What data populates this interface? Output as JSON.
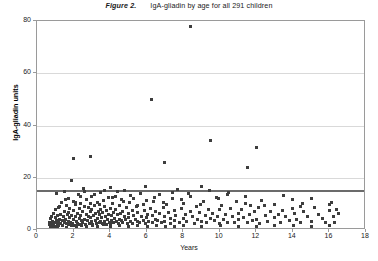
{
  "figure": {
    "number_label": "Figure 2.",
    "caption": "IgA-gliadin  by age for all 291 children",
    "x_axis_title": "Years",
    "y_axis_title": "IgA-gliadin units"
  },
  "chart_data": {
    "type": "scatter",
    "xlabel": "Years",
    "ylabel": "IgA-gliadin units",
    "xlim": [
      0,
      18
    ],
    "ylim": [
      0,
      80
    ],
    "xticks": [
      0,
      2,
      4,
      6,
      8,
      10,
      12,
      14,
      16,
      18
    ],
    "yticks": [
      0,
      20,
      40,
      60,
      80
    ],
    "grid": "horizontal-only",
    "legend": "none",
    "n_points": 291,
    "marker": "square",
    "marker_color": "#3d3d3d",
    "reference_line": {
      "orientation": "horizontal",
      "y": 15,
      "color": "#6b6b6b",
      "label": "cut-off"
    },
    "series": [
      {
        "name": "IgA-gliadin by age",
        "points": [
          [
            0.7,
            2.1
          ],
          [
            0.7,
            3.0
          ],
          [
            0.75,
            4.4
          ],
          [
            0.8,
            1.6
          ],
          [
            0.8,
            2.6
          ],
          [
            0.82,
            5.1
          ],
          [
            0.85,
            3.4
          ],
          [
            0.9,
            2.0
          ],
          [
            0.9,
            6.2
          ],
          [
            0.95,
            1.4
          ],
          [
            1.0,
            2.8
          ],
          [
            1.0,
            4.8
          ],
          [
            1.0,
            7.9
          ],
          [
            1.05,
            3.6
          ],
          [
            1.1,
            2.2
          ],
          [
            1.1,
            5.6
          ],
          [
            1.15,
            1.9
          ],
          [
            1.2,
            3.1
          ],
          [
            1.2,
            8.8
          ],
          [
            1.25,
            4.2
          ],
          [
            1.3,
            2.4
          ],
          [
            1.3,
            6.0
          ],
          [
            1.35,
            10.4
          ],
          [
            1.4,
            1.7
          ],
          [
            1.4,
            3.8
          ],
          [
            1.45,
            5.2
          ],
          [
            1.5,
            2.9
          ],
          [
            1.5,
            7.1
          ],
          [
            1.5,
            14.9
          ],
          [
            1.55,
            4.0
          ],
          [
            1.6,
            2.3
          ],
          [
            1.6,
            9.2
          ],
          [
            1.65,
            5.9
          ],
          [
            1.7,
            3.3
          ],
          [
            1.7,
            6.8
          ],
          [
            1.72,
            12.1
          ],
          [
            1.75,
            2.0
          ],
          [
            1.8,
            4.6
          ],
          [
            1.8,
            8.1
          ],
          [
            1.85,
            3.0
          ],
          [
            1.9,
            5.4
          ],
          [
            1.9,
            18.9
          ],
          [
            1.95,
            2.6
          ],
          [
            2.0,
            3.9
          ],
          [
            2.0,
            7.4
          ],
          [
            2.0,
            11.0
          ],
          [
            2.02,
            27.5
          ],
          [
            2.05,
            1.8
          ],
          [
            2.1,
            5.0
          ],
          [
            2.1,
            9.6
          ],
          [
            2.15,
            3.2
          ],
          [
            2.2,
            6.5
          ],
          [
            2.2,
            2.5
          ],
          [
            2.25,
            13.4
          ],
          [
            2.3,
            4.3
          ],
          [
            2.3,
            8.3
          ],
          [
            2.35,
            2.1
          ],
          [
            2.4,
            5.7
          ],
          [
            2.4,
            10.1
          ],
          [
            2.45,
            3.5
          ],
          [
            2.5,
            7.0
          ],
          [
            2.5,
            2.7
          ],
          [
            2.55,
            15.8
          ],
          [
            2.6,
            4.1
          ],
          [
            2.6,
            9.0
          ],
          [
            2.65,
            2.2
          ],
          [
            2.7,
            6.1
          ],
          [
            2.7,
            11.6
          ],
          [
            2.75,
            3.7
          ],
          [
            2.8,
            5.3
          ],
          [
            2.8,
            8.6
          ],
          [
            2.85,
            2.4
          ],
          [
            2.9,
            4.9
          ],
          [
            2.9,
            28.3
          ],
          [
            2.95,
            6.9
          ],
          [
            3.0,
            3.1
          ],
          [
            3.0,
            7.7
          ],
          [
            3.0,
            12.8
          ],
          [
            3.05,
            2.0
          ],
          [
            3.1,
            5.5
          ],
          [
            3.15,
            9.4
          ],
          [
            3.2,
            3.6
          ],
          [
            3.2,
            6.3
          ],
          [
            3.25,
            2.3
          ],
          [
            3.3,
            4.5
          ],
          [
            3.3,
            10.7
          ],
          [
            3.35,
            7.2
          ],
          [
            3.4,
            2.8
          ],
          [
            3.4,
            5.8
          ],
          [
            3.45,
            3.3
          ],
          [
            3.5,
            8.0
          ],
          [
            3.5,
            14.2
          ],
          [
            3.55,
            4.7
          ],
          [
            3.6,
            2.6
          ],
          [
            3.6,
            6.6
          ],
          [
            3.65,
            11.3
          ],
          [
            3.7,
            3.4
          ],
          [
            3.7,
            9.1
          ],
          [
            3.75,
            5.1
          ],
          [
            3.8,
            2.2
          ],
          [
            3.8,
            7.5
          ],
          [
            3.85,
            4.0
          ],
          [
            3.9,
            12.4
          ],
          [
            3.9,
            6.0
          ],
          [
            3.95,
            3.0
          ],
          [
            4.0,
            8.4
          ],
          [
            4.0,
            2.5
          ],
          [
            4.0,
            16.1
          ],
          [
            4.05,
            5.6
          ],
          [
            4.1,
            3.8
          ],
          [
            4.15,
            10.0
          ],
          [
            4.2,
            6.7
          ],
          [
            4.2,
            2.9
          ],
          [
            4.25,
            4.4
          ],
          [
            4.3,
            13.0
          ],
          [
            4.3,
            7.8
          ],
          [
            4.35,
            3.2
          ],
          [
            4.4,
            5.9
          ],
          [
            4.45,
            2.4
          ],
          [
            4.5,
            9.3
          ],
          [
            4.5,
            4.1
          ],
          [
            4.55,
            6.4
          ],
          [
            4.6,
            3.5
          ],
          [
            4.6,
            11.8
          ],
          [
            4.7,
            7.0
          ],
          [
            4.7,
            2.7
          ],
          [
            4.8,
            5.0
          ],
          [
            4.8,
            15.3
          ],
          [
            4.85,
            3.9
          ],
          [
            4.9,
            8.7
          ],
          [
            4.95,
            2.3
          ],
          [
            5.0,
            6.2
          ],
          [
            5.0,
            4.6
          ],
          [
            5.05,
            10.5
          ],
          [
            5.1,
            3.1
          ],
          [
            5.2,
            7.6
          ],
          [
            5.2,
            2.6
          ],
          [
            5.3,
            5.4
          ],
          [
            5.3,
            12.2
          ],
          [
            5.4,
            4.0
          ],
          [
            5.45,
            8.9
          ],
          [
            5.5,
            3.4
          ],
          [
            5.5,
            6.8
          ],
          [
            5.6,
            2.8
          ],
          [
            5.65,
            14.0
          ],
          [
            5.7,
            5.2
          ],
          [
            5.8,
            9.8
          ],
          [
            5.8,
            3.7
          ],
          [
            5.9,
            7.3
          ],
          [
            5.95,
            2.5
          ],
          [
            6.0,
            4.8
          ],
          [
            6.0,
            11.2
          ],
          [
            6.05,
            6.0
          ],
          [
            6.1,
            3.3
          ],
          [
            6.2,
            8.2
          ],
          [
            6.25,
            50.0
          ],
          [
            6.3,
            5.7
          ],
          [
            6.3,
            2.9
          ],
          [
            6.4,
            10.9
          ],
          [
            6.5,
            4.2
          ],
          [
            6.5,
            7.0
          ],
          [
            6.6,
            3.6
          ],
          [
            6.7,
            6.4
          ],
          [
            6.7,
            13.6
          ],
          [
            6.8,
            2.7
          ],
          [
            6.9,
            8.5
          ],
          [
            7.0,
            5.0
          ],
          [
            7.0,
            3.2
          ],
          [
            7.0,
            26.0
          ],
          [
            7.1,
            9.9
          ],
          [
            7.2,
            6.6
          ],
          [
            7.3,
            4.3
          ],
          [
            7.3,
            2.4
          ],
          [
            7.4,
            12.0
          ],
          [
            7.5,
            7.4
          ],
          [
            7.5,
            3.8
          ],
          [
            7.6,
            5.5
          ],
          [
            7.7,
            15.5
          ],
          [
            7.8,
            2.8
          ],
          [
            7.9,
            8.1
          ],
          [
            8.0,
            4.5
          ],
          [
            8.0,
            10.3
          ],
          [
            8.1,
            6.1
          ],
          [
            8.2,
            3.1
          ],
          [
            8.3,
            13.8
          ],
          [
            8.4,
            78.0
          ],
          [
            8.4,
            7.0
          ],
          [
            8.5,
            5.1
          ],
          [
            8.6,
            2.6
          ],
          [
            8.7,
            9.0
          ],
          [
            8.8,
            4.0
          ],
          [
            8.9,
            6.8
          ],
          [
            9.0,
            3.4
          ],
          [
            9.0,
            16.5
          ],
          [
            9.1,
            11.0
          ],
          [
            9.2,
            5.6
          ],
          [
            9.3,
            2.9
          ],
          [
            9.4,
            8.0
          ],
          [
            9.5,
            4.4
          ],
          [
            9.5,
            34.2
          ],
          [
            9.6,
            6.2
          ],
          [
            9.7,
            3.6
          ],
          [
            9.8,
            12.6
          ],
          [
            9.9,
            5.0
          ],
          [
            10.0,
            7.7
          ],
          [
            10.0,
            2.5
          ],
          [
            10.1,
            9.5
          ],
          [
            10.2,
            4.1
          ],
          [
            10.3,
            6.0
          ],
          [
            10.4,
            3.0
          ],
          [
            10.5,
            14.5
          ],
          [
            10.6,
            8.3
          ],
          [
            10.7,
            5.3
          ],
          [
            10.8,
            2.7
          ],
          [
            10.9,
            10.8
          ],
          [
            11.0,
            6.5
          ],
          [
            11.0,
            3.9
          ],
          [
            11.2,
            7.9
          ],
          [
            11.3,
            4.6
          ],
          [
            11.4,
            12.9
          ],
          [
            11.5,
            2.8
          ],
          [
            11.5,
            24.1
          ],
          [
            11.6,
            5.8
          ],
          [
            11.7,
            9.2
          ],
          [
            11.8,
            3.5
          ],
          [
            11.9,
            6.9
          ],
          [
            12.0,
            31.6
          ],
          [
            12.0,
            4.2
          ],
          [
            12.1,
            8.6
          ],
          [
            12.2,
            2.6
          ],
          [
            12.3,
            11.4
          ],
          [
            12.5,
            5.4
          ],
          [
            12.6,
            3.2
          ],
          [
            12.8,
            7.2
          ],
          [
            13.0,
            4.8
          ],
          [
            13.0,
            9.9
          ],
          [
            13.2,
            6.1
          ],
          [
            13.3,
            2.9
          ],
          [
            13.5,
            13.2
          ],
          [
            13.6,
            5.0
          ],
          [
            13.8,
            3.7
          ],
          [
            14.0,
            8.4
          ],
          [
            14.0,
            11.6
          ],
          [
            14.1,
            6.3
          ],
          [
            14.2,
            4.1
          ],
          [
            14.4,
            2.8
          ],
          [
            14.5,
            10.2
          ],
          [
            14.6,
            7.0
          ],
          [
            14.8,
            5.2
          ],
          [
            15.0,
            3.4
          ],
          [
            15.0,
            12.1
          ],
          [
            15.2,
            8.8
          ],
          [
            15.4,
            6.0
          ],
          [
            15.6,
            4.4
          ],
          [
            15.8,
            2.7
          ],
          [
            16.0,
            9.6
          ],
          [
            16.0,
            7.3
          ],
          [
            16.1,
            10.5
          ],
          [
            16.2,
            5.1
          ],
          [
            16.3,
            3.0
          ],
          [
            16.4,
            8.0
          ],
          [
            16.5,
            6.4
          ],
          [
            1.05,
            13.9
          ],
          [
            1.25,
            9.1
          ],
          [
            1.55,
            11.8
          ],
          [
            2.12,
            10.6
          ],
          [
            2.38,
            12.7
          ],
          [
            2.62,
            14.8
          ],
          [
            2.92,
            10.0
          ],
          [
            3.12,
            13.5
          ],
          [
            3.42,
            9.7
          ],
          [
            3.72,
            15.0
          ],
          [
            4.12,
            12.5
          ],
          [
            4.42,
            14.6
          ],
          [
            4.72,
            11.1
          ],
          [
            5.12,
            13.1
          ],
          [
            5.52,
            9.5
          ],
          [
            5.92,
            16.8
          ],
          [
            6.42,
            12.3
          ],
          [
            6.92,
            10.4
          ],
          [
            7.42,
            14.3
          ],
          [
            7.92,
            11.5
          ],
          [
            8.42,
            13.0
          ],
          [
            8.92,
            9.8
          ],
          [
            9.42,
            15.1
          ],
          [
            9.92,
            11.9
          ],
          [
            10.42,
            13.4
          ],
          [
            11.42,
            10.1
          ],
          [
            12.42,
            9.4
          ],
          [
            13.42,
            7.6
          ],
          [
            14.42,
            9.0
          ],
          [
            0.72,
            1.2
          ],
          [
            0.88,
            1.5
          ],
          [
            1.12,
            1.3
          ],
          [
            1.38,
            1.8
          ],
          [
            1.62,
            1.1
          ],
          [
            1.88,
            1.6
          ],
          [
            2.18,
            1.4
          ],
          [
            2.42,
            1.9
          ],
          [
            2.72,
            1.2
          ],
          [
            3.02,
            1.7
          ],
          [
            3.32,
            1.3
          ],
          [
            3.62,
            2.0
          ],
          [
            4.02,
            1.5
          ],
          [
            4.52,
            1.8
          ],
          [
            5.02,
            1.4
          ],
          [
            5.52,
            1.6
          ],
          [
            6.02,
            1.3
          ],
          [
            6.52,
            1.9
          ],
          [
            7.02,
            1.5
          ],
          [
            7.52,
            1.2
          ],
          [
            8.02,
            1.7
          ],
          [
            9.02,
            1.4
          ],
          [
            10.02,
            1.8
          ],
          [
            11.02,
            1.5
          ],
          [
            12.02,
            1.3
          ],
          [
            13.02,
            1.9
          ],
          [
            14.02,
            1.6
          ],
          [
            15.02,
            1.4
          ],
          [
            16.02,
            1.7
          ]
        ]
      }
    ]
  }
}
